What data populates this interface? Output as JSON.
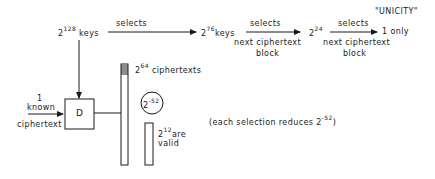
{
  "nodes": {
    "keys128": {
      "base": "2",
      "exp": "128",
      "label": "keys"
    },
    "keys76": {
      "base": "2",
      "exp": "76",
      "label": "keys"
    },
    "keys24": {
      "base": "2",
      "exp": "24"
    },
    "unicity": {
      "title": "\"UNICITY\"",
      "label": "1 only"
    },
    "known": {
      "line1": "1",
      "line2": "known",
      "line3": "ciphertext"
    },
    "decrypt": {
      "label": "D"
    },
    "ciphertexts": {
      "base": "2",
      "exp": "64",
      "label": "ciphertexts"
    },
    "prob": {
      "base": "2",
      "exp": "-52"
    },
    "valid": {
      "base": "2",
      "exp": "12",
      "label1": "are",
      "label2": "valid"
    }
  },
  "edges": {
    "e1": {
      "label": "selects"
    },
    "e2": {
      "label": "selects",
      "sub1": "next ciphertext",
      "sub2": "block"
    },
    "e3": {
      "label": "selects",
      "sub1": "next ciphertext",
      "sub2": "block"
    }
  },
  "note": {
    "text": "(each selection reduces ",
    "base": "2",
    "exp": "-52",
    "close": ")"
  }
}
